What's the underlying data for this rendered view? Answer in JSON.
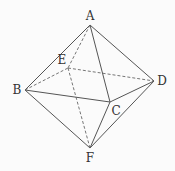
{
  "figure": {
    "type": "octahedron",
    "vertices": {
      "A": {
        "label": "A",
        "x": 90,
        "y": 25,
        "lx": 90,
        "ly": 20
      },
      "B": {
        "label": "B",
        "x": 25,
        "y": 90,
        "lx": 17,
        "ly": 94
      },
      "C": {
        "label": "C",
        "x": 110,
        "y": 102,
        "lx": 116,
        "ly": 115
      },
      "D": {
        "label": "D",
        "x": 154,
        "y": 81,
        "lx": 162,
        "ly": 85
      },
      "E": {
        "label": "E",
        "x": 68,
        "y": 68,
        "lx": 62,
        "ly": 64
      },
      "F": {
        "label": "F",
        "x": 90,
        "y": 148,
        "lx": 90,
        "ly": 162
      }
    },
    "solid_edges": [
      [
        "A",
        "B"
      ],
      [
        "A",
        "C"
      ],
      [
        "A",
        "D"
      ],
      [
        "B",
        "C"
      ],
      [
        "C",
        "D"
      ],
      [
        "B",
        "F"
      ],
      [
        "C",
        "F"
      ],
      [
        "D",
        "F"
      ]
    ],
    "dashed_edges": [
      [
        "A",
        "E"
      ],
      [
        "B",
        "E"
      ],
      [
        "E",
        "D"
      ],
      [
        "E",
        "F"
      ]
    ],
    "colors": {
      "line": "#555555",
      "label": "#333333"
    }
  }
}
